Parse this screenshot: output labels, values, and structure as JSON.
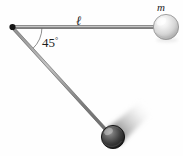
{
  "figure": {
    "background_color": "#fefefe",
    "width": 183,
    "height": 156
  },
  "labels": {
    "angle_value": "45",
    "angle_degree_symbol": "°",
    "length_symbol": "ℓ",
    "mass_symbol": "m"
  },
  "colors": {
    "rod_color": "#6e6e6e",
    "rod_highlight": "#b5b5b5",
    "arc_color": "#7a7a7a",
    "pivot_color": "#111111",
    "ball_top_light": "#f2f2f2",
    "ball_top_mid": "#cfcfcf",
    "ball_top_dark": "#9a9a9a",
    "ball_bottom_light": "#8c8c8c",
    "ball_bottom_mid": "#4a4a4a",
    "ball_bottom_dark": "#1c1c1c",
    "blur_color": "#b9b9b9"
  },
  "geometry": {
    "pivot": {
      "x": 12,
      "y": 27,
      "radius": 3
    },
    "top_ball": {
      "cx": 166,
      "cy": 27,
      "r": 12.5
    },
    "bottom_ball": {
      "cx": 113,
      "cy": 137,
      "r": 11.5
    },
    "horizontal_rod": {
      "x1": 12,
      "y1": 27,
      "x2": 156,
      "y2": 27
    },
    "diagonal_rod": {
      "x1": 12,
      "y1": 27,
      "x2": 106,
      "y2": 130
    },
    "angle_arc": {
      "radius": 30,
      "start_deg": 0,
      "end_deg": 47
    },
    "motion_blur_angle_deg": -42
  },
  "annotations": {
    "angle_label_text": "45°",
    "length_label_text": "ℓ",
    "mass_label_text": "m"
  }
}
